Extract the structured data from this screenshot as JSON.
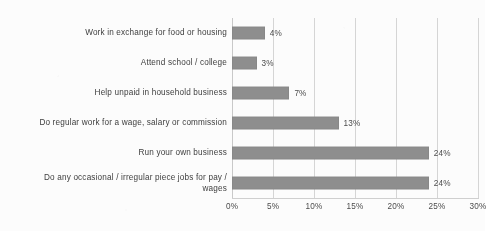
{
  "chart_data": {
    "type": "bar",
    "orientation": "horizontal",
    "title": "",
    "xlabel": "",
    "ylabel": "",
    "xlim": [
      0,
      30
    ],
    "xtick_labels": [
      "0%",
      "5%",
      "10%",
      "15%",
      "20%",
      "25%",
      "30%"
    ],
    "xticks": [
      0,
      5,
      10,
      15,
      20,
      25,
      30
    ],
    "grid": true,
    "legend": false,
    "bar_color": "#8d8d8d",
    "categories": [
      "Work in exchange for food or housing",
      "Attend school / college",
      "Help unpaid in household business",
      "Do regular  work for a wage, salary or commission",
      "Run your own business",
      "Do any occasional / irregular piece jobs for pay /\nwages"
    ],
    "values": [
      4,
      3,
      7,
      13,
      24,
      24
    ],
    "data_labels": [
      "4%",
      "3%",
      "7%",
      "13%",
      "24%",
      "24%"
    ]
  },
  "caption": {
    "remnant": ""
  }
}
